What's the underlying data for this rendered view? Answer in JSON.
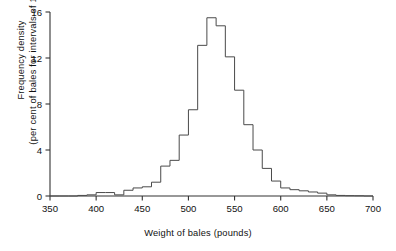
{
  "chart_data": {
    "type": "bar",
    "title": "",
    "xlabel": "Weight of bales (pounds)",
    "ylabel_line1": "Frequency density",
    "ylabel_line2": "(per cent of bales for intervals of 10 lb.)",
    "xlim": [
      350,
      700
    ],
    "ylim": [
      0,
      16
    ],
    "bin_width": 10,
    "xticks": [
      350,
      400,
      450,
      500,
      550,
      600,
      650,
      700
    ],
    "xtick_labels": [
      "350",
      "400",
      "450",
      "500",
      "550",
      "600",
      "650",
      "700"
    ],
    "yticks": [
      0,
      4,
      8,
      12,
      16
    ],
    "ytick_labels": [
      "0",
      "4",
      "8",
      "12",
      "16"
    ],
    "grid": false,
    "legend": null,
    "series_name": "Frequency density of bale weights",
    "bin_starts": [
      350,
      360,
      370,
      380,
      390,
      400,
      410,
      420,
      430,
      440,
      450,
      460,
      470,
      480,
      490,
      500,
      510,
      520,
      530,
      540,
      550,
      560,
      570,
      580,
      590,
      600,
      610,
      620,
      630,
      640,
      650,
      660,
      670,
      680,
      690
    ],
    "values": [
      0.0,
      0.0,
      0.0,
      0.05,
      0.1,
      0.3,
      0.3,
      0.1,
      0.5,
      0.7,
      0.8,
      1.2,
      2.6,
      3.1,
      5.3,
      7.5,
      13.1,
      15.5,
      14.8,
      12.1,
      9.2,
      6.2,
      4.0,
      2.4,
      1.3,
      0.7,
      0.55,
      0.45,
      0.35,
      0.25,
      0.1,
      0.05,
      0.03,
      0.02,
      0.0
    ],
    "peak_value": 15.5,
    "peak_bin": "510-520",
    "line_color": "#4a4a4a",
    "axis_color": "#333333",
    "background_color": "#ffffff"
  },
  "axes": {
    "x_axis_name": "Weight of bales (pounds)",
    "y_axis_name": "Frequency density (per cent of bales for intervals of 10 lb.)"
  }
}
